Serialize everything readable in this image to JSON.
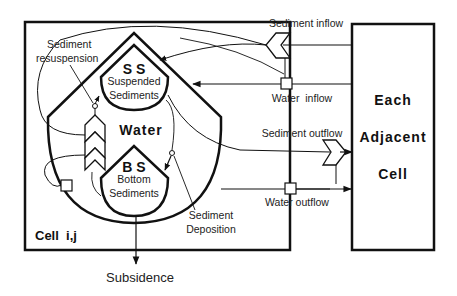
{
  "diagram": {
    "cell": {
      "label": "Cell  i,j"
    },
    "adjacent": {
      "line1": "Each",
      "line2": "Adjacent",
      "line3": "Cell"
    },
    "water": {
      "label": "Water"
    },
    "suspended": {
      "abbr": "S S",
      "line1": "Suspended",
      "line2": "Sediments"
    },
    "bottom": {
      "abbr": "B S",
      "line1": "Bottom",
      "line2": "Sediments"
    },
    "processes": {
      "resuspension_line1": "Sediment",
      "resuspension_line2": "resuspension",
      "deposition_line1": "Sediment",
      "deposition_line2": "Deposition",
      "subsidence": "Subsidence"
    },
    "flows": {
      "sediment_inflow": "Sediment inflow",
      "water_inflow": "Water  inflow",
      "sediment_outflow": "Sediment outflow",
      "water_outflow": "Water outflow"
    },
    "colors": {
      "stroke": "#111111",
      "background": "#ffffff"
    }
  }
}
